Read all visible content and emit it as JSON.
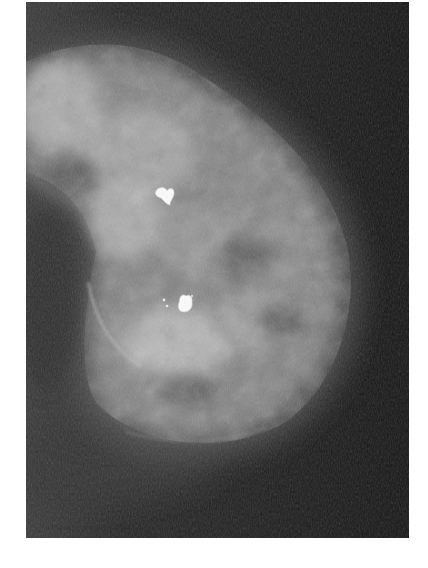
{
  "image": {
    "kind": "mammogram",
    "description": "Grayscale X-ray mammogram of breast tissue with two bright calcification spots",
    "colors": {
      "background": "#191919",
      "tissue_dark": "#5a5a5a",
      "tissue_mid": "#8c8c8c",
      "tissue_bright": "#c8c8c8",
      "calcification": "#ffffff"
    },
    "findings": [
      {
        "label": "calcification-upper",
        "x": 162,
        "y": 195
      },
      {
        "label": "calcification-lower",
        "x": 185,
        "y": 302
      }
    ]
  }
}
